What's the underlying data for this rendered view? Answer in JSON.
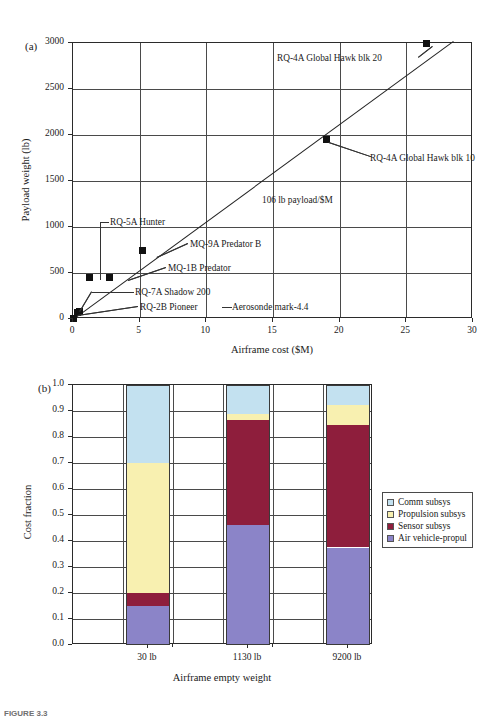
{
  "figure": {
    "caption": "FIGURE 3.3",
    "panel_a_tag": "(a)",
    "panel_b_tag": "(b)"
  },
  "chart_data": [
    {
      "type": "scatter",
      "panel": "(a)",
      "title": "",
      "xlabel": "Airframe cost ($M)",
      "ylabel": "Payload weight (lb)",
      "xlim": [
        0,
        30
      ],
      "ylim": [
        0,
        3000
      ],
      "xticks": [
        "0",
        "5",
        "10",
        "15",
        "20",
        "25",
        "30"
      ],
      "yticks": [
        "0",
        "500",
        "1000",
        "1500",
        "2000",
        "2500",
        "3000"
      ],
      "grid": true,
      "legend": "none",
      "trendline": {
        "label": "106 lb payload/$M",
        "slope": 106,
        "intercept": 0,
        "x_start": 0,
        "x_end": 28.5
      },
      "points": [
        {
          "label": "Aerosonde mark-4.4",
          "x": 0.05,
          "y": 10
        },
        {
          "label": "RQ-2B Pioneer",
          "x": 0.35,
          "y": 75
        },
        {
          "label": "RQ-7A Shadow 200",
          "x": 0.5,
          "y": 85
        },
        {
          "label": "RQ-5A Hunter",
          "x": 1.2,
          "y": 455
        },
        {
          "label": "MQ-1B Predator",
          "x": 2.7,
          "y": 455
        },
        {
          "label": "MQ-9A Predator B",
          "x": 5.2,
          "y": 750
        },
        {
          "label": "RQ-4A Global Hawk blk 10",
          "x": 19.0,
          "y": 1950
        },
        {
          "label": "RQ-4A Global Hawk blk 20",
          "x": 26.5,
          "y": 3000
        }
      ],
      "annotations": [
        "RQ-4A Global Hawk blk 20",
        "RQ-4A Global Hawk blk 10",
        "106 lb payload/$M",
        "RQ-5A Hunter",
        "MQ-9A Predator B",
        "MQ-1B Predator",
        "RQ-7A Shadow 200",
        "RQ-2B Pioneer",
        "Aerosonde mark-4.4"
      ]
    },
    {
      "type": "bar",
      "stacked": true,
      "panel": "(b)",
      "title": "",
      "xlabel": "Airframe empty weight",
      "ylabel": "Cost fraction",
      "ylim": [
        0,
        1.0
      ],
      "yticks": [
        "0.0",
        "0.1",
        "0.2",
        "0.3",
        "0.4",
        "0.5",
        "0.6",
        "0.7",
        "0.8",
        "0.9",
        "1.0"
      ],
      "categories": [
        "30 lb",
        "1130 lb",
        "9200 lb"
      ],
      "grid": true,
      "legend_position": "right",
      "series": [
        {
          "name": "Air vehicle-propul",
          "color": "#8b84c8",
          "values": [
            0.15,
            0.46,
            0.375
          ]
        },
        {
          "name": "Sensor subsys",
          "color": "#8e1e3c",
          "values": [
            0.05,
            0.405,
            0.47
          ]
        },
        {
          "name": "Propulsion subsys",
          "color": "#f8f0b0",
          "values": [
            0.5,
            0.025,
            0.08
          ]
        },
        {
          "name": "Comm subsys",
          "color": "#c3e1f0",
          "values": [
            0.3,
            0.11,
            0.075
          ]
        }
      ]
    }
  ],
  "legend": {
    "items": [
      {
        "label": "Comm subsys",
        "color": "#c3e1f0"
      },
      {
        "label": "Propulsion subsys",
        "color": "#f8f0b0"
      },
      {
        "label": "Sensor subsys",
        "color": "#8e1e3c"
      },
      {
        "label": "Air vehicle-propul",
        "color": "#8b84c8"
      }
    ]
  }
}
